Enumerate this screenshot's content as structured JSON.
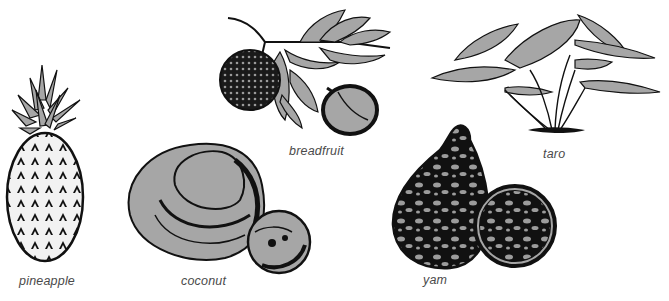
{
  "figure": {
    "items": [
      {
        "id": "pineapple",
        "label": "pineapple"
      },
      {
        "id": "coconut",
        "label": "coconut"
      },
      {
        "id": "breadfruit",
        "label": "breadfruit"
      },
      {
        "id": "yam",
        "label": "yam"
      },
      {
        "id": "taro",
        "label": "taro"
      }
    ],
    "colors": {
      "fill_gray": "#a6a6a6",
      "ink": "#111111",
      "label": "#4a4a4a",
      "background": "#ffffff"
    }
  }
}
